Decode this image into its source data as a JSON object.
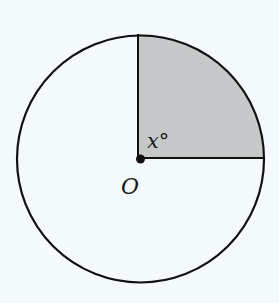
{
  "diagram": {
    "type": "circle-sector",
    "center_label": "O",
    "angle_label": "x°",
    "angle_variable": "x",
    "angle_unit": "°",
    "sector": {
      "description": "shaded quarter sector between vertical radius (up) and horizontal radius (right)",
      "start_direction": "up",
      "end_direction": "right"
    },
    "colors": {
      "background": "#f4fafb",
      "circle_fill": "#f4fafb",
      "sector_fill": "#c6c9c9",
      "stroke": "#111111"
    }
  }
}
